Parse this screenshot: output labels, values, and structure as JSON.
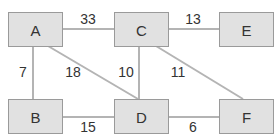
{
  "diagram": {
    "type": "weighted-graph",
    "nodes": [
      {
        "id": "A",
        "label": "A"
      },
      {
        "id": "B",
        "label": "B"
      },
      {
        "id": "C",
        "label": "C"
      },
      {
        "id": "D",
        "label": "D"
      },
      {
        "id": "E",
        "label": "E"
      },
      {
        "id": "F",
        "label": "F"
      }
    ],
    "edges": [
      {
        "from": "A",
        "to": "C",
        "weight": "33"
      },
      {
        "from": "C",
        "to": "E",
        "weight": "13"
      },
      {
        "from": "A",
        "to": "B",
        "weight": "7"
      },
      {
        "from": "A",
        "to": "D",
        "weight": "18"
      },
      {
        "from": "C",
        "to": "D",
        "weight": "10"
      },
      {
        "from": "C",
        "to": "F",
        "weight": "11"
      },
      {
        "from": "B",
        "to": "D",
        "weight": "15"
      },
      {
        "from": "D",
        "to": "F",
        "weight": "6"
      }
    ]
  }
}
